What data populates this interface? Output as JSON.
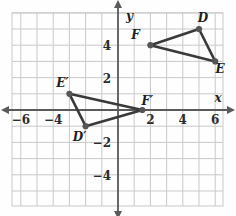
{
  "figure": {
    "kind": "coordinate-plane-diagram",
    "background_color": "#fefefe",
    "grid_color": "#c9c9c9",
    "axis_color": "#5a5a5a",
    "shape_color": "#3a3a3a",
    "vertex_color": "#555555",
    "label_color": "#1e1e1e"
  },
  "axes": {
    "x_axis_label": "x",
    "y_axis_label": "y",
    "x_ticks": [
      {
        "value": -6,
        "label": "−6"
      },
      {
        "value": -4,
        "label": "−4"
      },
      {
        "value": 2,
        "label": "2"
      },
      {
        "value": 4,
        "label": "4"
      },
      {
        "value": 6,
        "label": "6"
      }
    ],
    "y_ticks": [
      {
        "value": 4,
        "label": "4"
      },
      {
        "value": 2,
        "label": "2"
      },
      {
        "value": -2,
        "label": "−2"
      },
      {
        "value": -4,
        "label": "−4"
      }
    ],
    "x_range": [
      -6.8,
      6.8
    ],
    "y_range": [
      -5.8,
      6.0
    ],
    "grid": true,
    "grid_step": 1,
    "arrowheads": [
      "left",
      "right",
      "up",
      "down"
    ]
  },
  "chart_data": {
    "type": "scatter",
    "title": "",
    "xlabel": "x",
    "ylabel": "y",
    "xlim": [
      -6.8,
      6.8
    ],
    "ylim": [
      -5.8,
      6.0
    ],
    "grid": true,
    "series": [
      {
        "name": "Triangle DEF",
        "closed": true,
        "points": [
          {
            "label": "D",
            "x": 5,
            "y": 5,
            "label_dx": 4,
            "label_dy": -7
          },
          {
            "label": "E",
            "x": 6,
            "y": 3,
            "label_dx": 5,
            "label_dy": 12
          },
          {
            "label": "F",
            "x": 2,
            "y": 4,
            "label_dx": -15,
            "label_dy": -6
          }
        ]
      },
      {
        "name": "Triangle D'E'F'",
        "closed": true,
        "points": [
          {
            "label": "D′",
            "x": -2,
            "y": -1,
            "label_dx": -6,
            "label_dy": 15
          },
          {
            "label": "E′",
            "x": -3,
            "y": 1,
            "label_dx": -7,
            "label_dy": -7
          },
          {
            "label": "F′",
            "x": 1.5,
            "y": 0,
            "label_dx": 5,
            "label_dy": -5
          }
        ]
      }
    ]
  },
  "labels": {
    "D": "D",
    "E": "E",
    "F": "F",
    "D_prime": "D′",
    "E_prime": "E′",
    "F_prime": "F′"
  }
}
